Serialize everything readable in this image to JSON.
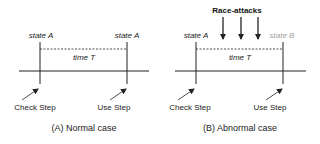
{
  "panels": [
    {
      "id": "A",
      "caption": "(A) Normal case",
      "state_left": "state A",
      "state_right": "state A",
      "state_right_color": "#222222",
      "interval": "time T",
      "step_left": "Check Step",
      "step_right": "Use Step"
    },
    {
      "id": "B",
      "caption": "(B) Abnormal case",
      "state_left": "state A",
      "state_right": "state B",
      "state_right_color": "#a0a0a0",
      "interval": "time T",
      "step_left": "Check Step",
      "step_right": "Use Step",
      "attack_label": "Race-attacks",
      "attack_arrow_count": 3
    }
  ],
  "colors": {
    "line": "#222222",
    "text": "#222222",
    "muted": "#a0a0a0"
  }
}
